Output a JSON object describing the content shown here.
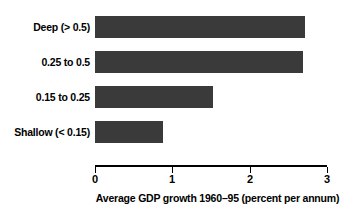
{
  "chart_data": {
    "type": "bar",
    "orientation": "horizontal",
    "title": "",
    "xlabel": "Average GDP growth 1960–95 (percent per annum)",
    "ylabel": "",
    "categories": [
      "Deep (> 0.5)",
      "0.25 to 0.5",
      "0.15 to 0.25",
      "Shallow (< 0.15)"
    ],
    "values": [
      2.72,
      2.69,
      1.53,
      0.88
    ],
    "xlim": [
      0,
      3
    ],
    "xticks": [
      0,
      1,
      2,
      3
    ],
    "xtick_labels": [
      "0",
      "1",
      "2",
      "3"
    ],
    "grid": false,
    "legend": null,
    "bar_color": "#3a3a3a",
    "axis_color": "#000000",
    "text_color": "#000000",
    "background": "#ffffff"
  },
  "bars": [
    {
      "label": "Deep (> 0.5)",
      "value": 2.72,
      "top": 16,
      "bar_width_px": 210
    },
    {
      "label": "0.25 to 0.5",
      "value": 2.69,
      "top": 51,
      "bar_width_px": 208
    },
    {
      "label": "0.15 to 0.25",
      "value": 1.53,
      "top": 86,
      "bar_width_px": 118
    },
    {
      "label": "Shallow (< 0.15)",
      "value": 0.88,
      "top": 121,
      "bar_width_px": 68
    }
  ],
  "axis": {
    "title": "Average GDP growth 1960–95 (percent per annum)",
    "ticks": [
      {
        "label": "0",
        "x": 95
      },
      {
        "label": "1",
        "x": 172
      },
      {
        "label": "2",
        "x": 250
      },
      {
        "label": "3",
        "x": 327
      }
    ]
  }
}
